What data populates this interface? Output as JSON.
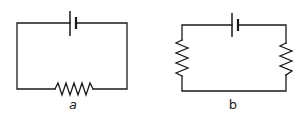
{
  "diagrams": [
    {
      "id": "a",
      "label": "a",
      "components": [
        {
          "type": "battery",
          "position": "top"
        },
        {
          "type": "resistor",
          "position": "bottom"
        }
      ]
    },
    {
      "id": "b",
      "label": "b",
      "components": [
        {
          "type": "battery",
          "position": "top"
        },
        {
          "type": "resistor",
          "position": "left"
        },
        {
          "type": "resistor",
          "position": "right"
        }
      ]
    }
  ],
  "colors": {
    "line": "#1a1a1a",
    "background": "#ffffff"
  }
}
